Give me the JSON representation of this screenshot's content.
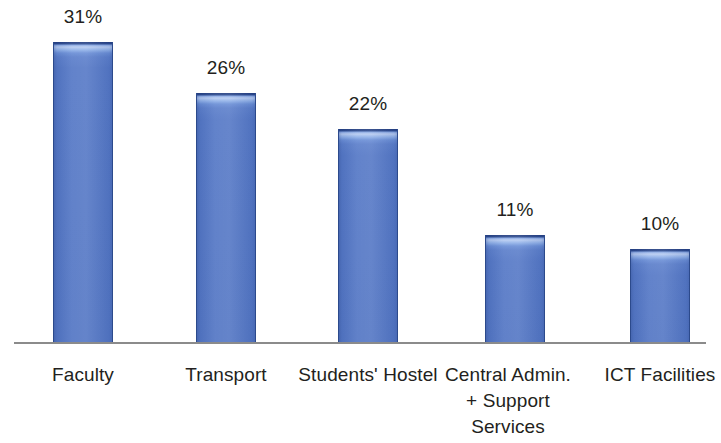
{
  "chart_data": {
    "type": "bar",
    "title": "",
    "subtitle": "",
    "xlabel": "",
    "ylabel": "",
    "ylim": [
      0,
      36
    ],
    "grid": false,
    "legend": false,
    "legend_position": "none",
    "axis_line_color": "#8b8b8b",
    "bar_color": "#5376c4",
    "bar_highlight_color": "#b9cdf2",
    "bar_edge_color": "#2c4a8c",
    "background_color": "#ffffff",
    "value_suffix": "%",
    "categories": [
      "Faculty",
      "Transport",
      "Students' Hostel",
      "Central Admin. + Support Services",
      "ICT Facilities"
    ],
    "values": [
      31,
      26,
      22,
      11,
      10
    ],
    "data_labels": [
      "31%",
      "26%",
      "22%",
      "11%",
      "10%"
    ],
    "tick_labels": [
      [
        "Faculty"
      ],
      [
        "Transport"
      ],
      [
        "Students' Hostel"
      ],
      [
        "Central Admin.",
        "+ Support",
        "Services"
      ],
      [
        "ICT Facilities"
      ]
    ]
  },
  "bars": [
    {
      "name": "bar-faculty",
      "label": "31%",
      "category": "Faculty",
      "value": 31,
      "left": 53,
      "width": 60,
      "top": 41,
      "height": 302,
      "label_left": 23,
      "label_top": 6,
      "tick_left": 23,
      "tick_top": 10,
      "tick_width": 120,
      "lines": [
        "Faculty"
      ]
    },
    {
      "name": "bar-transport",
      "label": "26%",
      "category": "Transport",
      "value": 26,
      "left": 196,
      "width": 60,
      "top": 92,
      "height": 251,
      "label_left": 166,
      "label_top": 57,
      "tick_left": 166,
      "tick_top": 10,
      "tick_width": 120,
      "lines": [
        "Transport"
      ]
    },
    {
      "name": "bar-students-hostel",
      "label": "22%",
      "category": "Students' Hostel",
      "value": 22,
      "left": 338,
      "width": 60,
      "top": 128,
      "height": 215,
      "label_left": 308,
      "label_top": 93,
      "tick_left": 288,
      "tick_top": 10,
      "tick_width": 160,
      "lines": [
        "Students' Hostel"
      ]
    },
    {
      "name": "bar-central-admin",
      "label": "11%",
      "category": "Central Admin. + Support Services",
      "value": 11,
      "left": 485,
      "width": 60,
      "top": 234,
      "height": 109,
      "label_left": 455,
      "label_top": 199,
      "tick_left": 428,
      "tick_top": 10,
      "tick_width": 160,
      "lines": [
        "Central Admin.",
        "+ Support",
        "Services"
      ]
    },
    {
      "name": "bar-ict-facilities",
      "label": "10%",
      "category": "ICT Facilities",
      "value": 10,
      "left": 630,
      "width": 60,
      "top": 248,
      "height": 95,
      "label_left": 600,
      "label_top": 213,
      "tick_left": 585,
      "tick_top": 10,
      "tick_width": 150,
      "lines": [
        "ICT Facilities"
      ]
    }
  ]
}
